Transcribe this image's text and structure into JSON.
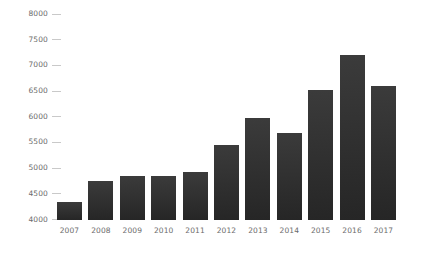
{
  "chart_data": {
    "type": "bar",
    "title": "",
    "subtitle": "",
    "xlabel": "",
    "ylabel": "",
    "categories": [
      "2007",
      "2008",
      "2009",
      "2010",
      "2011",
      "2012",
      "2013",
      "2014",
      "2015",
      "2016",
      "2017"
    ],
    "values": [
      4350,
      4750,
      4850,
      4850,
      4930,
      5450,
      5970,
      5680,
      6530,
      7200,
      6600
    ],
    "series": [
      {
        "name": "",
        "values": [
          4350,
          4750,
          4850,
          4850,
          4930,
          5450,
          5970,
          5680,
          6530,
          7200,
          6600
        ]
      }
    ],
    "ylim": [
      4000,
      8000
    ],
    "yticks": [
      4000,
      4500,
      5000,
      5500,
      6000,
      6500,
      7000,
      7500,
      8000
    ],
    "ytick_labels": [
      "4000",
      "4500",
      "5000",
      "5500",
      "6000",
      "6500",
      "7000",
      "7500",
      "8000"
    ],
    "grid": false,
    "legend": false,
    "legend_position": "none",
    "annotations": [],
    "colors": {
      "bar_top": "#3b3b3b",
      "bar_bottom": "#262626",
      "tick": "#c9c9c9",
      "tick_label": "#6b6b6b",
      "background": "#ffffff"
    }
  }
}
